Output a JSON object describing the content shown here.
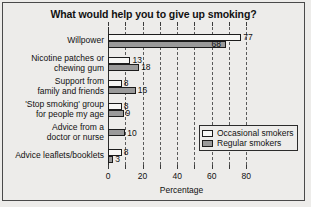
{
  "chart_data": {
    "type": "bar",
    "orientation": "horizontal",
    "title": "What would help you to give up smoking?",
    "xlabel": "Percentage",
    "ylabel": "",
    "xlim": [
      0,
      85
    ],
    "xticks": [
      0,
      20,
      40,
      60,
      80
    ],
    "xtick_labels": [
      "0",
      "20",
      "40",
      "60",
      "80"
    ],
    "minor_xticks": [
      10,
      30,
      50,
      70
    ],
    "grid": "vertical-dashed",
    "legend_position": "right-inside",
    "categories": [
      "Willpower",
      "Nicotine patches or\nchewing gum",
      "Support from\nfamily and friends",
      "'Stop smoking' group\nfor people my age",
      "Advice from a\ndoctor or nurse",
      "Advice leaflets/booklets"
    ],
    "series": [
      {
        "name": "Occasional smokers",
        "color": "#f7f7f5",
        "values": [
          77,
          13,
          8,
          8,
          null,
          8
        ]
      },
      {
        "name": "Regular smokers",
        "color": "#9a9a9a",
        "values": [
          68,
          18,
          16,
          9,
          10,
          3
        ]
      }
    ],
    "data_labels": {
      "Willpower": {
        "occasional": "77",
        "regular": "68"
      },
      "Nicotine patches or chewing gum": {
        "occasional": "13",
        "regular": "18"
      },
      "Support from family and friends": {
        "occasional": "8",
        "regular": "16"
      },
      "'Stop smoking' group for people my age": {
        "occasional": "8",
        "regular": "9"
      },
      "Advice from a doctor or nurse": {
        "occasional": "",
        "regular": "10"
      },
      "Advice leaflets/booklets": {
        "occasional": "8",
        "regular": "3"
      }
    }
  },
  "legend": {
    "items": [
      {
        "label": "Occasional smokers",
        "swatch": "occasional"
      },
      {
        "label": "Regular smokers",
        "swatch": "regular"
      }
    ]
  }
}
